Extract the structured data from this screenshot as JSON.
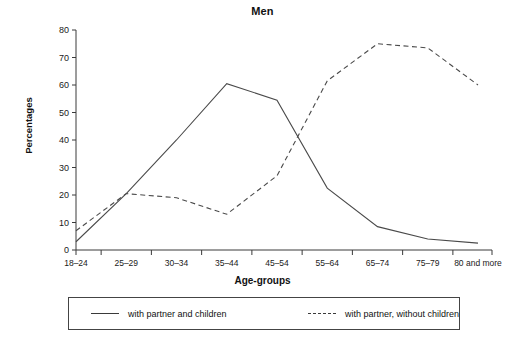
{
  "chart_data": {
    "type": "line",
    "title": "Men",
    "xlabel": "Age-groups",
    "ylabel": "Percentages",
    "categories": [
      "18–24",
      "25–29",
      "30–34",
      "35–44",
      "45–54",
      "55–64",
      "65–74",
      "75–79",
      "80 and more"
    ],
    "yticks": [
      0,
      10,
      20,
      30,
      40,
      50,
      60,
      70,
      80
    ],
    "ylim": [
      0,
      80
    ],
    "grid": false,
    "legend_position": "bottom",
    "series": [
      {
        "name": "with partner and children",
        "style": "solid",
        "color": "#4a4a4a",
        "values": [
          3,
          20.5,
          40,
          60.5,
          54.5,
          22.5,
          8.5,
          4,
          2.5
        ]
      },
      {
        "name": "with partner, without children",
        "style": "dashed",
        "color": "#4a4a4a",
        "values": [
          7,
          20.5,
          19,
          13,
          27,
          61.5,
          75,
          73.5,
          60
        ]
      }
    ]
  },
  "legend": {
    "items": [
      {
        "label": "with partner and children",
        "style": "solid"
      },
      {
        "label": "with partner, without children",
        "style": "dashed"
      }
    ]
  }
}
